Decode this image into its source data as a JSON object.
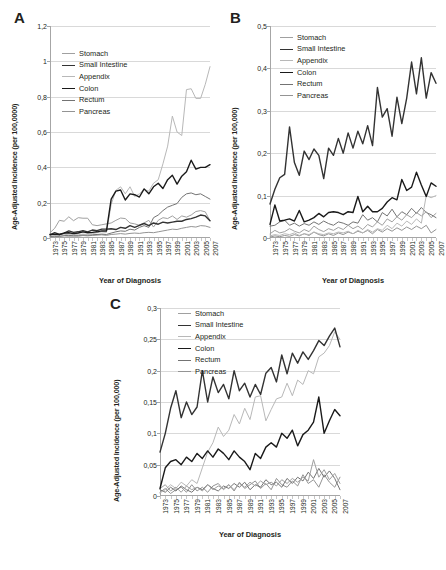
{
  "figure": {
    "panels": [
      "A",
      "B",
      "C"
    ],
    "caption": ""
  },
  "panelA": {
    "letter": "A",
    "ylabel": "Age-Adjusted Incidence (per 100,0000)",
    "xlabel": "Year of Diagnosis"
  },
  "panelB": {
    "letter": "B",
    "ylabel": "Age-Adjusted Incidence (per 100,000)",
    "xlabel": "Year of Diagnosis"
  },
  "panelC": {
    "letter": "C",
    "ylabel": "Age-Adjusted Incidence (per 100,000)",
    "xlabel": "Year of Diagnosis"
  },
  "legend": {
    "entries": [
      {
        "label": "Stomach",
        "color": "#a0a0a0",
        "width": 1.0
      },
      {
        "label": "Small Intestine",
        "color": "#333333",
        "width": 1.4
      },
      {
        "label": "Appendix",
        "color": "#b8b8b8",
        "width": 1.0
      },
      {
        "label": "Colon",
        "color": "#1a1a1a",
        "width": 1.4
      },
      {
        "label": "Rectum",
        "color": "#737373",
        "width": 1.0
      },
      {
        "label": "Pancreas",
        "color": "#949494",
        "width": 1.0
      }
    ]
  },
  "chart_data": [
    {
      "type": "line",
      "panel": "A",
      "title": "A",
      "xlabel": "Year of Diagnosis",
      "ylabel": "Age-Adjusted Incidence (per 100,0000)",
      "ylim": [
        0,
        1.2
      ],
      "yticks": [
        0,
        0.2,
        0.4,
        0.6,
        0.8,
        1.0,
        1.2
      ],
      "ytick_labels": [
        "0",
        "0,2",
        "0,4",
        "0,6",
        "0,8",
        "1",
        "1,2"
      ],
      "grid": true,
      "legend_position": "upper-left",
      "x": [
        1973,
        1974,
        1975,
        1976,
        1977,
        1978,
        1979,
        1980,
        1981,
        1982,
        1983,
        1984,
        1985,
        1986,
        1987,
        1988,
        1989,
        1990,
        1991,
        1992,
        1993,
        1994,
        1995,
        1996,
        1997,
        1998,
        1999,
        2000,
        2001,
        2002,
        2003,
        2004,
        2005,
        2006,
        2007
      ],
      "xticks": [
        1973,
        1975,
        1977,
        1979,
        1981,
        1983,
        1985,
        1987,
        1989,
        1991,
        1993,
        1995,
        1997,
        1999,
        2001,
        2003,
        2005,
        2007
      ],
      "series": [
        {
          "name": "Stomach",
          "values": [
            0.03,
            0.055,
            0.1,
            0.095,
            0.12,
            0.098,
            0.115,
            0.112,
            0.112,
            0.075,
            0.07,
            0.075,
            0.08,
            0.085,
            0.1,
            0.113,
            0.11,
            0.085,
            0.08,
            0.072,
            0.085,
            0.1,
            0.062,
            0.1,
            0.115,
            0.11,
            0.125,
            0.105,
            0.125,
            0.118,
            0.13,
            0.15,
            0.155,
            0.148,
            0.098
          ]
        },
        {
          "name": "Small Intestine",
          "values": [
            0.018,
            0.03,
            0.02,
            0.028,
            0.04,
            0.032,
            0.035,
            0.042,
            0.035,
            0.045,
            0.042,
            0.05,
            0.05,
            0.052,
            0.048,
            0.06,
            0.055,
            0.07,
            0.06,
            0.072,
            0.082,
            0.07,
            0.085,
            0.078,
            0.09,
            0.085,
            0.09,
            0.095,
            0.095,
            0.105,
            0.11,
            0.118,
            0.13,
            0.125,
            0.098
          ]
        },
        {
          "name": "Appendix",
          "values": [
            0.012,
            0.02,
            0.015,
            0.018,
            0.022,
            0.02,
            0.018,
            0.022,
            0.02,
            0.025,
            0.03,
            0.035,
            0.032,
            0.19,
            0.27,
            0.29,
            0.25,
            0.29,
            0.235,
            0.25,
            0.275,
            0.265,
            0.31,
            0.33,
            0.42,
            0.52,
            0.69,
            0.6,
            0.58,
            0.84,
            0.845,
            0.79,
            0.79,
            0.87,
            0.97
          ]
        },
        {
          "name": "Colon",
          "values": [
            0.02,
            0.022,
            0.02,
            0.028,
            0.03,
            0.025,
            0.028,
            0.035,
            0.03,
            0.032,
            0.035,
            0.04,
            0.04,
            0.22,
            0.265,
            0.272,
            0.215,
            0.25,
            0.245,
            0.232,
            0.278,
            0.25,
            0.29,
            0.31,
            0.28,
            0.33,
            0.355,
            0.305,
            0.35,
            0.375,
            0.44,
            0.39,
            0.4,
            0.4,
            0.415
          ]
        },
        {
          "name": "Rectum",
          "values": [
            0.008,
            0.012,
            0.01,
            0.014,
            0.015,
            0.012,
            0.014,
            0.018,
            0.016,
            0.018,
            0.02,
            0.022,
            0.02,
            0.028,
            0.035,
            0.04,
            0.038,
            0.05,
            0.045,
            0.06,
            0.07,
            0.06,
            0.115,
            0.13,
            0.155,
            0.175,
            0.185,
            0.195,
            0.23,
            0.25,
            0.255,
            0.245,
            0.25,
            0.235,
            0.22
          ]
        },
        {
          "name": "Pancreas",
          "values": [
            0.005,
            0.008,
            0.01,
            0.012,
            0.01,
            0.012,
            0.01,
            0.014,
            0.012,
            0.015,
            0.016,
            0.018,
            0.015,
            0.02,
            0.022,
            0.025,
            0.022,
            0.026,
            0.028,
            0.026,
            0.03,
            0.032,
            0.03,
            0.035,
            0.04,
            0.045,
            0.05,
            0.048,
            0.055,
            0.06,
            0.065,
            0.062,
            0.07,
            0.068,
            0.06
          ]
        }
      ]
    },
    {
      "type": "line",
      "panel": "B",
      "title": "B",
      "xlabel": "Year of Diagnosis",
      "ylabel": "Age-Adjusted Incidence (per 100,000)",
      "ylim": [
        0,
        0.5
      ],
      "yticks": [
        0,
        0.1,
        0.2,
        0.3,
        0.4,
        0.5
      ],
      "ytick_labels": [
        "0",
        "0,1",
        "0,2",
        "0,3",
        "0,4",
        "0,5"
      ],
      "grid": true,
      "legend_position": "upper-left",
      "x": [
        1973,
        1974,
        1975,
        1976,
        1977,
        1978,
        1979,
        1980,
        1981,
        1982,
        1983,
        1984,
        1985,
        1986,
        1987,
        1988,
        1989,
        1990,
        1991,
        1992,
        1993,
        1994,
        1995,
        1996,
        1997,
        1998,
        1999,
        2000,
        2001,
        2002,
        2003,
        2004,
        2005,
        2006,
        2007
      ],
      "xticks": [
        1973,
        1975,
        1977,
        1979,
        1981,
        1983,
        1985,
        1987,
        1989,
        1991,
        1993,
        1995,
        1997,
        1999,
        2001,
        2003,
        2005,
        2007
      ],
      "series": [
        {
          "name": "Stomach",
          "values": [
            0.01,
            0.018,
            0.012,
            0.015,
            0.022,
            0.016,
            0.012,
            0.02,
            0.015,
            0.028,
            0.02,
            0.015,
            0.022,
            0.018,
            0.025,
            0.02,
            0.03,
            0.022,
            0.028,
            0.02,
            0.032,
            0.026,
            0.038,
            0.03,
            0.045,
            0.038,
            0.05,
            0.042,
            0.055,
            0.048,
            0.06,
            0.052,
            0.062,
            0.048,
            0.058
          ]
        },
        {
          "name": "Small Intestine",
          "values": [
            0.08,
            0.115,
            0.142,
            0.15,
            0.262,
            0.178,
            0.148,
            0.205,
            0.185,
            0.21,
            0.195,
            0.14,
            0.212,
            0.195,
            0.235,
            0.2,
            0.248,
            0.212,
            0.252,
            0.222,
            0.265,
            0.218,
            0.355,
            0.285,
            0.305,
            0.24,
            0.332,
            0.27,
            0.33,
            0.415,
            0.34,
            0.425,
            0.33,
            0.39,
            0.365
          ]
        },
        {
          "name": "Appendix",
          "values": [
            0.005,
            0.008,
            0.006,
            0.01,
            0.008,
            0.012,
            0.006,
            0.01,
            0.008,
            0.014,
            0.01,
            0.008,
            0.012,
            0.01,
            0.014,
            0.012,
            0.016,
            0.01,
            0.018,
            0.012,
            0.02,
            0.014,
            0.022,
            0.018,
            0.03,
            0.022,
            0.035,
            0.028,
            0.04,
            0.032,
            0.045,
            0.035,
            0.1,
            0.095,
            0.1
          ]
        },
        {
          "name": "Colon",
          "values": [
            0.032,
            0.078,
            0.04,
            0.042,
            0.045,
            0.04,
            0.065,
            0.038,
            0.042,
            0.048,
            0.058,
            0.05,
            0.06,
            0.062,
            0.06,
            0.055,
            0.062,
            0.06,
            0.098,
            0.062,
            0.075,
            0.062,
            0.062,
            0.07,
            0.085,
            0.095,
            0.09,
            0.138,
            0.112,
            0.12,
            0.155,
            0.125,
            0.098,
            0.13,
            0.122
          ]
        },
        {
          "name": "Rectum",
          "values": [
            0.028,
            0.03,
            0.038,
            0.042,
            0.03,
            0.035,
            0.028,
            0.034,
            0.03,
            0.038,
            0.032,
            0.04,
            0.034,
            0.03,
            0.038,
            0.035,
            0.03,
            0.038,
            0.035,
            0.055,
            0.042,
            0.048,
            0.038,
            0.06,
            0.052,
            0.068,
            0.05,
            0.062,
            0.055,
            0.07,
            0.058,
            0.072,
            0.06,
            0.055,
            0.048
          ]
        },
        {
          "name": "Pancreas",
          "values": [
            0.002,
            0.005,
            0.003,
            0.006,
            0.004,
            0.008,
            0.005,
            0.01,
            0.006,
            0.014,
            0.008,
            0.005,
            0.01,
            0.006,
            0.012,
            0.008,
            0.014,
            0.01,
            0.016,
            0.012,
            0.018,
            0.01,
            0.02,
            0.014,
            0.022,
            0.016,
            0.024,
            0.018,
            0.026,
            0.02,
            0.028,
            0.022,
            0.03,
            0.012,
            0.02
          ]
        }
      ]
    },
    {
      "type": "line",
      "panel": "C",
      "title": "C",
      "xlabel": "Year of Diagnosis",
      "ylabel": "Age-Adjusted Incidence (per 100,000)",
      "ylim": [
        0,
        0.3
      ],
      "yticks": [
        0,
        0.05,
        0.1,
        0.15,
        0.2,
        0.25,
        0.3
      ],
      "ytick_labels": [
        "0",
        "0,05",
        "0,1",
        "0,15",
        "0,2",
        "0,25",
        "0,3"
      ],
      "grid": true,
      "legend_position": "upper-left",
      "x": [
        1973,
        1974,
        1975,
        1976,
        1977,
        1978,
        1979,
        1980,
        1981,
        1982,
        1983,
        1984,
        1985,
        1986,
        1987,
        1988,
        1989,
        1990,
        1991,
        1992,
        1993,
        1994,
        1995,
        1996,
        1997,
        1998,
        1999,
        2000,
        2001,
        2002,
        2003,
        2004,
        2005,
        2006,
        2007
      ],
      "xticks": [
        1973,
        1975,
        1977,
        1979,
        1981,
        1983,
        1985,
        1987,
        1989,
        1991,
        1993,
        1995,
        1997,
        1999,
        2001,
        2003,
        2005,
        2007
      ],
      "series": [
        {
          "name": "Stomach",
          "values": [
            0.012,
            0.018,
            0.008,
            0.014,
            0.006,
            0.016,
            0.01,
            0.014,
            0.008,
            0.018,
            0.01,
            0.016,
            0.012,
            0.018,
            0.01,
            0.02,
            0.014,
            0.022,
            0.016,
            0.024,
            0.018,
            0.022,
            0.016,
            0.026,
            0.02,
            0.028,
            0.022,
            0.03,
            0.024,
            0.058,
            0.03,
            0.042,
            0.026,
            0.036,
            0.02
          ]
        },
        {
          "name": "Small Intestine",
          "values": [
            0.07,
            0.1,
            0.14,
            0.168,
            0.125,
            0.15,
            0.13,
            0.142,
            0.2,
            0.15,
            0.19,
            0.165,
            0.178,
            0.155,
            0.2,
            0.168,
            0.18,
            0.158,
            0.178,
            0.162,
            0.196,
            0.205,
            0.182,
            0.225,
            0.195,
            0.228,
            0.212,
            0.23,
            0.218,
            0.232,
            0.248,
            0.24,
            0.255,
            0.268,
            0.238
          ]
        },
        {
          "name": "Appendix",
          "values": [
            0.005,
            0.01,
            0.018,
            0.012,
            0.022,
            0.016,
            0.026,
            0.02,
            0.045,
            0.07,
            0.085,
            0.11,
            0.095,
            0.105,
            0.13,
            0.115,
            0.14,
            0.122,
            0.158,
            0.16,
            0.12,
            0.138,
            0.155,
            0.158,
            0.18,
            0.16,
            0.185,
            0.178,
            0.2,
            0.195,
            0.222,
            0.228,
            0.24,
            0.262,
            0.25
          ]
        },
        {
          "name": "Colon",
          "values": [
            0.012,
            0.045,
            0.055,
            0.058,
            0.05,
            0.062,
            0.055,
            0.068,
            0.06,
            0.072,
            0.062,
            0.075,
            0.068,
            0.058,
            0.072,
            0.062,
            0.055,
            0.042,
            0.068,
            0.06,
            0.078,
            0.085,
            0.078,
            0.1,
            0.092,
            0.105,
            0.08,
            0.098,
            0.105,
            0.118,
            0.158,
            0.1,
            0.12,
            0.138,
            0.128
          ]
        },
        {
          "name": "Rectum",
          "values": [
            0.01,
            0.006,
            0.014,
            0.008,
            0.016,
            0.01,
            0.006,
            0.014,
            0.01,
            0.018,
            0.012,
            0.008,
            0.016,
            0.012,
            0.02,
            0.014,
            0.022,
            0.01,
            0.018,
            0.014,
            0.026,
            0.018,
            0.022,
            0.014,
            0.028,
            0.02,
            0.03,
            0.024,
            0.038,
            0.028,
            0.044,
            0.03,
            0.04,
            0.028,
            0.01
          ]
        },
        {
          "name": "Pancreas",
          "values": [
            0.006,
            0.012,
            0.004,
            0.01,
            0.014,
            0.006,
            0.018,
            0.008,
            0.014,
            0.006,
            0.016,
            0.02,
            0.01,
            0.018,
            0.008,
            0.022,
            0.012,
            0.018,
            0.024,
            0.012,
            0.02,
            0.01,
            0.028,
            0.018,
            0.014,
            0.024,
            0.016,
            0.034,
            0.02,
            0.026,
            0.014,
            0.034,
            0.022,
            0.014,
            0.03
          ]
        }
      ]
    }
  ]
}
